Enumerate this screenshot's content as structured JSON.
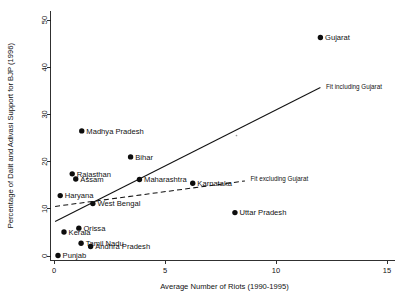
{
  "chart_data": {
    "type": "scatter",
    "title": "",
    "xlabel": "Average Number of Riots (1990-1995)",
    "ylabel": "Percentage of Dalit and Adivasi Support for BJP (1996)",
    "xlim": [
      -0.2,
      15.6
    ],
    "ylim": [
      -1.5,
      52
    ],
    "xticks": [
      0,
      5,
      10,
      15
    ],
    "xticklabels": [
      "0",
      "5",
      "10",
      "15"
    ],
    "yticks": [
      0,
      10,
      20,
      30,
      40,
      50
    ],
    "yticklabels": [
      "0",
      "10",
      "20",
      "30",
      "40",
      "50"
    ],
    "grid": false,
    "legend": "none",
    "points": [
      {
        "label": "Gujarat",
        "x": 12.0,
        "y": 46.3,
        "label_side": "right"
      },
      {
        "label": "Madhya Pradesh",
        "x": 1.25,
        "y": 26.5,
        "label_side": "right"
      },
      {
        "label": "Bihar",
        "x": 3.45,
        "y": 21.0,
        "label_side": "right"
      },
      {
        "label": "Rajasthan",
        "x": 0.82,
        "y": 17.4,
        "label_side": "right"
      },
      {
        "label": "Assam",
        "x": 0.98,
        "y": 16.3,
        "label_side": "right"
      },
      {
        "label": "Maharashtra",
        "x": 3.85,
        "y": 16.2,
        "label_side": "right"
      },
      {
        "label": "Karnataka",
        "x": 6.25,
        "y": 15.4,
        "label_side": "right"
      },
      {
        "label": "Haryana",
        "x": 0.28,
        "y": 12.8,
        "label_side": "right"
      },
      {
        "label": "West Bengal",
        "x": 1.75,
        "y": 11.1,
        "label_side": "right"
      },
      {
        "label": "Uttar Pradesh",
        "x": 8.15,
        "y": 9.2,
        "label_side": "right"
      },
      {
        "label": "Orissa",
        "x": 1.12,
        "y": 5.9,
        "label_side": "right"
      },
      {
        "label": "Kerala",
        "x": 0.45,
        "y": 5.1,
        "label_side": "right"
      },
      {
        "label": "Tamil Nadu",
        "x": 1.22,
        "y": 2.7,
        "label_side": "right"
      },
      {
        "label": "Andhra Pradesh",
        "x": 1.65,
        "y": 2.0,
        "label_side": "right"
      },
      {
        "label": "Punjab",
        "x": 0.18,
        "y": 0.1,
        "label_side": "right"
      }
    ],
    "fits": [
      {
        "name": "Fit including Gujarat",
        "style": "solid",
        "x0": 0.05,
        "y0": 7.3,
        "x1": 12.0,
        "y1": 35.7
      },
      {
        "name": "Fit excluding Gujarat",
        "style": "dashed",
        "x0": 0.05,
        "y0": 10.5,
        "x1": 8.6,
        "y1": 15.9
      }
    ],
    "annotations": [
      {
        "text": "Fit including Gujarat",
        "x": 12.25,
        "y": 35.9
      },
      {
        "text": "Fit excluding Gujarat",
        "x": 8.85,
        "y": 16.4
      }
    ],
    "colors": {
      "point": "#0d0d0d",
      "line": "#111111",
      "axis": "#1a1a1a",
      "background": "#ffffff"
    }
  }
}
